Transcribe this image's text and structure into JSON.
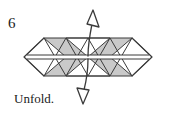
{
  "figure": {
    "step_number": "6",
    "caption": "Unfold.",
    "width": 173,
    "height": 116,
    "background_color": "#ffffff"
  },
  "colors": {
    "stroke": "#3b3b3b",
    "shaded_fill": "#c9c9c9",
    "white_fill": "#ffffff",
    "text": "#1a1a1a",
    "arrow_stroke": "#3b3b3b"
  },
  "shape": {
    "name": "triangle-tessellation-strip",
    "description": "Elongated horizontal band of alternating shaded and white triangles with white diamonds at both ends and a thin white seam band through the middle",
    "left_tip_x": 24,
    "right_tip_x": 152,
    "top_edge_y": 38,
    "bottom_edge_y": 76,
    "mid_y": 57,
    "seam_top_y": 55,
    "seam_bottom_y": 59,
    "body_left_x": 44,
    "body_right_x": 132,
    "cell_width": 22,
    "cell_count": 4,
    "upper_triangles": [
      {
        "index": 0,
        "fill": "shaded",
        "orientation": "down"
      },
      {
        "index": 1,
        "fill": "white",
        "orientation": "down"
      },
      {
        "index": 2,
        "fill": "shaded",
        "orientation": "down"
      },
      {
        "index": 3,
        "fill": "white",
        "orientation": "down"
      }
    ],
    "upper_gap_triangles": [
      {
        "index": 0,
        "fill": "shaded",
        "orientation": "up"
      },
      {
        "index": 1,
        "fill": "shaded",
        "orientation": "up"
      },
      {
        "index": 2,
        "fill": "shaded",
        "orientation": "up"
      }
    ],
    "lower_triangles": [
      {
        "index": 0,
        "fill": "shaded",
        "orientation": "up"
      },
      {
        "index": 1,
        "fill": "white",
        "orientation": "up"
      },
      {
        "index": 2,
        "fill": "shaded",
        "orientation": "up"
      },
      {
        "index": 3,
        "fill": "white",
        "orientation": "up"
      }
    ],
    "end_diamonds": [
      {
        "side": "left",
        "fill": "white"
      },
      {
        "side": "right",
        "fill": "white"
      }
    ]
  },
  "arrows": [
    {
      "name": "unfold-arrow-up",
      "direction": "up",
      "style": "hollow-outline",
      "tail_x": 88,
      "tail_y": 55,
      "head_x": 92,
      "head_y": 12
    },
    {
      "name": "unfold-arrow-down",
      "direction": "down",
      "style": "hollow-outline",
      "tail_x": 88,
      "tail_y": 60,
      "head_x": 86,
      "head_y": 102
    }
  ]
}
